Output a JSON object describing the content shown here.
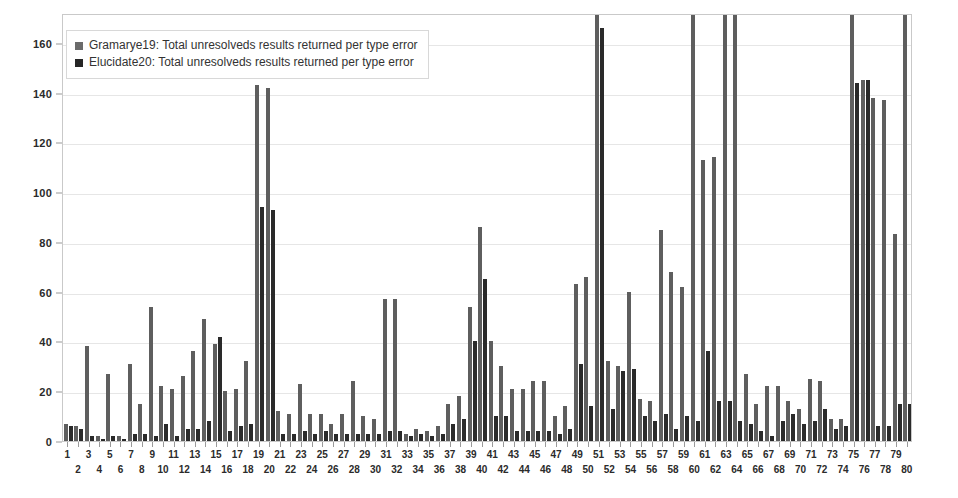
{
  "chart_data": {
    "type": "bar",
    "title": "",
    "xlabel": "",
    "ylabel": "",
    "ylim": [
      0,
      172
    ],
    "yticks": [
      0,
      20,
      40,
      60,
      80,
      100,
      120,
      140,
      160
    ],
    "grid": true,
    "legend_position": "top-left",
    "clip_note": "Bars exceeding the plot top (~172) are visually clipped at the frame edge.",
    "categories": [
      "1",
      "2",
      "3",
      "4",
      "5",
      "6",
      "7",
      "8",
      "9",
      "10",
      "11",
      "12",
      "13",
      "14",
      "15",
      "16",
      "17",
      "18",
      "19",
      "20",
      "21",
      "22",
      "23",
      "24",
      "25",
      "26",
      "27",
      "28",
      "29",
      "30",
      "31",
      "32",
      "33",
      "34",
      "35",
      "36",
      "37",
      "38",
      "39",
      "40",
      "41",
      "42",
      "43",
      "44",
      "45",
      "46",
      "47",
      "48",
      "49",
      "50",
      "51",
      "52",
      "53",
      "54",
      "55",
      "56",
      "57",
      "58",
      "59",
      "60",
      "61",
      "62",
      "63",
      "64",
      "65",
      "66",
      "67",
      "68",
      "69",
      "70",
      "71",
      "72",
      "73",
      "74",
      "75",
      "76",
      "77",
      "78",
      "79",
      "80"
    ],
    "series": [
      {
        "name": "Gramarye19: Total unresolveds results returned per type error",
        "color": "#5e5e5e",
        "values": [
          7,
          6,
          38,
          2,
          27,
          2,
          31,
          15,
          54,
          22,
          21,
          26,
          36,
          49,
          39,
          20,
          21,
          32,
          143,
          142,
          12,
          11,
          23,
          11,
          11,
          7,
          11,
          24,
          10,
          9,
          57,
          57,
          3,
          5,
          4,
          6,
          15,
          18,
          54,
          86,
          40,
          30,
          21,
          21,
          24,
          24,
          10,
          14,
          63,
          66,
          190,
          32,
          30,
          60,
          17,
          16,
          85,
          68,
          62,
          190,
          113,
          114,
          190,
          190,
          27,
          15,
          22,
          22,
          16,
          13,
          25,
          24,
          9,
          9,
          190,
          145,
          138,
          137,
          83,
          190
        ]
      },
      {
        "name": "Elucidate20:  Total unresolveds results returned per type error",
        "color": "#2a2a2a",
        "values": [
          6,
          5,
          2,
          1,
          2,
          1,
          3,
          3,
          2,
          7,
          2,
          5,
          5,
          8,
          42,
          4,
          6,
          7,
          94,
          93,
          3,
          3,
          4,
          3,
          4,
          3,
          3,
          3,
          3,
          3,
          4,
          4,
          2,
          3,
          2,
          3,
          7,
          9,
          40,
          65,
          10,
          10,
          4,
          4,
          4,
          4,
          3,
          5,
          31,
          14,
          166,
          13,
          28,
          29,
          10,
          8,
          11,
          5,
          10,
          8,
          36,
          16,
          16,
          8,
          7,
          4,
          2,
          8,
          11,
          7,
          8,
          13,
          5,
          6,
          144,
          145,
          6,
          6,
          15,
          15
        ]
      }
    ]
  },
  "legend": {
    "items": [
      {
        "label": "Gramarye19: Total unresolveds results returned per type error",
        "swatch": "light-gray-square"
      },
      {
        "label": "Elucidate20:  Total unresolveds results returned per type error",
        "swatch": "dark-gray-square"
      }
    ]
  },
  "colors": {
    "series_light": "#5e5e5e",
    "series_dark": "#2a2a2a",
    "grid": "#e6e6e6",
    "frame": "#c9c9c9",
    "background": "#ffffff",
    "text": "#2b2b2b"
  }
}
